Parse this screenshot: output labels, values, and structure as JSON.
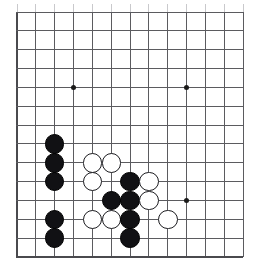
{
  "board": {
    "kind": "go-board",
    "label": "Go board position diagram",
    "board_size": 19,
    "view": "bottom-left corner, cropped",
    "geometry": {
      "origin_x": 17,
      "origin_y": 12,
      "spacing": 18.85,
      "cols_visible": 13,
      "rows_visible": 14,
      "stone_diameter": 19.5,
      "star_radius": 2.5
    },
    "colors": {
      "background": "#ffffff",
      "grid": "#5b5b5f",
      "grid_faint": "#c9c9cc",
      "edge": "#4a4a4e",
      "black_stone": "#111114",
      "white_stone": "#ffffff",
      "white_stone_outline": "#1c1c20",
      "star_point": "#1a1a1a"
    },
    "edges": {
      "left": true,
      "bottom": true,
      "top": false,
      "right": false
    },
    "star_points": [
      {
        "col": 3,
        "row": 4
      },
      {
        "col": 9,
        "row": 4
      },
      {
        "col": 9,
        "row": 10
      }
    ],
    "stones": [
      {
        "color": "black",
        "col": 2,
        "row": 7
      },
      {
        "color": "black",
        "col": 2,
        "row": 8
      },
      {
        "color": "white",
        "col": 4,
        "row": 8
      },
      {
        "color": "white",
        "col": 5,
        "row": 8
      },
      {
        "color": "black",
        "col": 2,
        "row": 9
      },
      {
        "color": "white",
        "col": 4,
        "row": 9
      },
      {
        "color": "black",
        "col": 6,
        "row": 9
      },
      {
        "color": "white",
        "col": 7,
        "row": 9
      },
      {
        "color": "black",
        "col": 5,
        "row": 10
      },
      {
        "color": "black",
        "col": 6,
        "row": 10
      },
      {
        "color": "white",
        "col": 7,
        "row": 10
      },
      {
        "color": "black",
        "col": 2,
        "row": 11
      },
      {
        "color": "white",
        "col": 4,
        "row": 11
      },
      {
        "color": "white",
        "col": 5,
        "row": 11
      },
      {
        "color": "black",
        "col": 6,
        "row": 11
      },
      {
        "color": "white",
        "col": 8,
        "row": 11
      },
      {
        "color": "black",
        "col": 2,
        "row": 12
      },
      {
        "color": "black",
        "col": 6,
        "row": 12
      }
    ],
    "counts": {
      "black_stones": 10,
      "white_stones": 8,
      "total_stones": 18
    }
  },
  "chart_data": {
    "type": "table",
    "columns": [
      "color",
      "col",
      "row"
    ],
    "rows": [
      [
        "black",
        2,
        7
      ],
      [
        "black",
        2,
        8
      ],
      [
        "white",
        4,
        8
      ],
      [
        "white",
        5,
        8
      ],
      [
        "black",
        2,
        9
      ],
      [
        "white",
        4,
        9
      ],
      [
        "black",
        6,
        9
      ],
      [
        "white",
        7,
        9
      ],
      [
        "black",
        5,
        10
      ],
      [
        "black",
        6,
        10
      ],
      [
        "white",
        7,
        10
      ],
      [
        "black",
        2,
        11
      ],
      [
        "white",
        4,
        11
      ],
      [
        "white",
        5,
        11
      ],
      [
        "black",
        6,
        11
      ],
      [
        "white",
        8,
        11
      ],
      [
        "black",
        2,
        12
      ],
      [
        "black",
        6,
        12
      ]
    ]
  }
}
